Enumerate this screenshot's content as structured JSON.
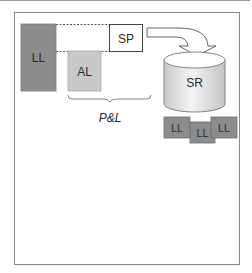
{
  "diagram": {
    "ll_bar": {
      "label": "LL"
    },
    "al_bar": {
      "label": "AL"
    },
    "sp_box": {
      "label": "SP"
    },
    "brace_label": "P&L",
    "cylinder": {
      "label": "SR"
    },
    "ll_boxes": [
      {
        "label": "LL"
      },
      {
        "label": "LL"
      },
      {
        "label": "LL"
      }
    ],
    "colors": {
      "ll_fill": "#8c8c8c",
      "al_fill": "#c8c8c8",
      "sp_fill": "#ffffff",
      "stroke": "#6e6e6e",
      "frame": "#8a8a8a"
    }
  }
}
